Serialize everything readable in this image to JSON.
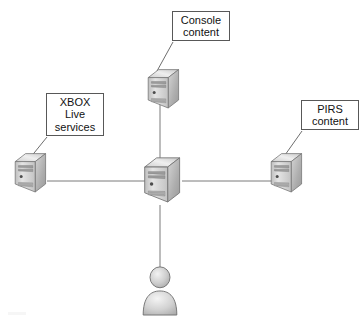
{
  "diagram": {
    "type": "network-topology",
    "background_color": "#ffffff",
    "line_color": "#7a7a7a",
    "box_border_color": "#585858",
    "text_color": "#111111",
    "labels": [
      {
        "id": "console-content",
        "text": "Console\ncontent",
        "x": 172,
        "y": 11,
        "width": 58,
        "height": 30
      },
      {
        "id": "xbox-live-services",
        "text": "XBOX\nLive\nservices",
        "x": 46,
        "y": 93,
        "width": 58,
        "height": 43
      },
      {
        "id": "pirs-content",
        "text": "PIRS\ncontent",
        "x": 301,
        "y": 100,
        "width": 58,
        "height": 30
      }
    ],
    "nodes": [
      {
        "id": "server-top",
        "icon": "server-tower-icon",
        "x": 145,
        "y": 68,
        "scale": 0.8
      },
      {
        "id": "server-left",
        "icon": "server-tower-icon",
        "x": 12,
        "y": 152,
        "scale": 0.8
      },
      {
        "id": "server-center",
        "icon": "server-tower-icon",
        "x": 142,
        "y": 157,
        "scale": 0.92
      },
      {
        "id": "server-right",
        "icon": "server-tower-icon",
        "x": 268,
        "y": 152,
        "scale": 0.8
      },
      {
        "id": "user-actor",
        "icon": "user-person-icon",
        "x": 145,
        "y": 265,
        "scale": 1.0
      }
    ],
    "connections": [
      {
        "from": "server-left",
        "to": "server-center",
        "orientation": "horizontal"
      },
      {
        "from": "server-center",
        "to": "server-right",
        "orientation": "horizontal"
      },
      {
        "from": "server-top",
        "to": "server-center",
        "orientation": "vertical"
      },
      {
        "from": "server-center",
        "to": "user-actor",
        "orientation": "vertical"
      }
    ],
    "leader_lines": [
      {
        "from": "console-content",
        "to": "server-top"
      },
      {
        "from": "xbox-live-services",
        "to": "server-left"
      },
      {
        "from": "pirs-content",
        "to": "server-right"
      }
    ]
  }
}
